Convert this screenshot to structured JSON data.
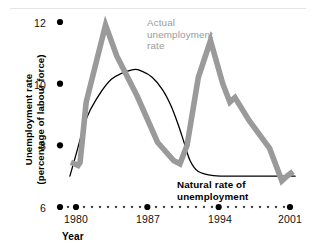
{
  "chart_data": {
    "type": "line",
    "title": "",
    "xlabel": "Year",
    "ylabel": "Unemployment rate (percentage of labour force)",
    "ylabel_line1": "Unemployment rate",
    "ylabel_line2": "(percentage of labour force)",
    "xlim": [
      1979,
      2001.6
    ],
    "ylim": [
      6,
      12.6
    ],
    "xticks": [
      1980,
      1987,
      1994,
      2001
    ],
    "xtick_labels": [
      "1980",
      "1987",
      "1994",
      "2001"
    ],
    "yticks": [
      6,
      8,
      10,
      12
    ],
    "ytick_labels": [
      "6",
      "8",
      "10",
      "12"
    ],
    "grid": false,
    "legend_position": "inline-annotations",
    "axis_style": "dotted-baseline-with-dot-markers",
    "series": [
      {
        "name": "Actual unemployment rate",
        "color": "#9a9a9a",
        "style": "thick-line",
        "label_text_line1": "Actual",
        "label_text_line2": "unemployment",
        "label_text_line3": "rate",
        "x": [
          1979.5,
          1980.2,
          1980.4,
          1981.0,
          1982.9,
          1984.0,
          1986.0,
          1988.0,
          1989.6,
          1990.2,
          1990.9,
          1992.0,
          1993.2,
          1994.4,
          1995.1,
          1995.6,
          1997.0,
          1999.0,
          2000.2,
          2000.7,
          2001.3
        ],
        "y": [
          7.45,
          7.35,
          7.45,
          9.4,
          11.9,
          10.9,
          9.6,
          8.1,
          7.5,
          7.4,
          8.0,
          10.2,
          11.4,
          10.0,
          9.4,
          9.55,
          8.8,
          7.9,
          6.85,
          7.0,
          7.15
        ]
      },
      {
        "name": "Natural rate of unemployment",
        "color": "#000000",
        "style": "thin-line",
        "label_text_line1": "Natural rate of",
        "label_text_line2": "unemployment",
        "x": [
          1979.4,
          1980.0,
          1981.0,
          1982.0,
          1983.5,
          1985.5,
          1986.5,
          1987.5,
          1988.5,
          1989.3,
          1990.0,
          1990.6,
          1991.2,
          1992.0,
          1993.5,
          1996.0,
          1999.0,
          2001.5
        ],
        "y": [
          7.0,
          7.7,
          8.85,
          9.5,
          10.15,
          10.45,
          10.4,
          10.2,
          9.8,
          9.3,
          8.7,
          8.1,
          7.5,
          7.15,
          7.02,
          7.0,
          7.0,
          7.0
        ]
      }
    ]
  },
  "axis": {
    "y_title_line1": "Unemployment rate",
    "y_title_line2": "(percentage of labour force)",
    "x_title": "Year",
    "ytick_12": "12",
    "ytick_10": "10",
    "ytick_8": "8",
    "ytick_6": "6",
    "xtick_1980": "1980",
    "xtick_1987": "1987",
    "xtick_1994": "1994",
    "xtick_2001": "2001"
  },
  "annotations": {
    "actual_l1": "Actual",
    "actual_l2": "unemployment",
    "actual_l3": "rate",
    "natural_l1": "Natural rate of",
    "natural_l2": "unemployment"
  },
  "colors": {
    "actual_series": "#9a9a9a",
    "natural_series": "#000000",
    "text": "#111111",
    "background": "#ffffff"
  }
}
